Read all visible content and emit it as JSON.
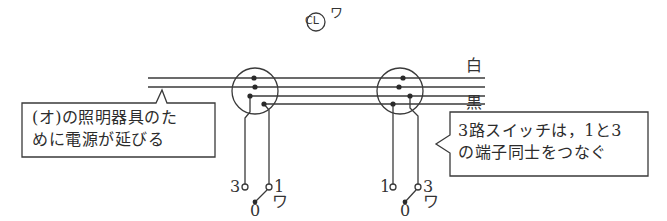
{
  "fixture": {
    "symbol": "CL",
    "label": "ワ"
  },
  "wires": {
    "white_label": "白",
    "black_label": "黒"
  },
  "callouts": {
    "left": {
      "line1": "(オ)の照明器具のた",
      "line2": "めに電源が延びる"
    },
    "right": {
      "line1": "3路スイッチは，1と3",
      "line2": "の端子同士をつなぐ"
    }
  },
  "switches": {
    "left": {
      "terminal_a": "3",
      "terminal_b": "1",
      "common": "0",
      "label": "ワ"
    },
    "right": {
      "terminal_a": "1",
      "terminal_b": "3",
      "common": "0",
      "label": "ワ"
    }
  },
  "colors": {
    "line": "#3a3a3a",
    "background": "#ffffff"
  }
}
